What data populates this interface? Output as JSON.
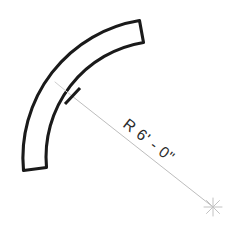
{
  "drawing": {
    "title": "Curved Wall Radius Dimension",
    "background_color": "#ffffff",
    "width": 243,
    "height": 238,
    "dimension": {
      "label": "R 6' - 0\"",
      "prefix": "R",
      "feet": "6'",
      "separator": "-",
      "inches": "0\"",
      "value_text": "6' - 0\"",
      "text_color": "#2b2b2b",
      "text_rotation_deg": 38
    },
    "leader": {
      "name": "radius-leader-line",
      "color": "#bdbdbd",
      "stroke_width": 1,
      "start_x": 72,
      "start_y": 96,
      "end_x": 213,
      "end_y": 207
    },
    "center_mark": {
      "name": "arc-center-crosshair",
      "color": "#c2c2c2",
      "x": 213,
      "y": 207,
      "arm_length": 9
    },
    "arc_tick": {
      "name": "arc-intersection-tick",
      "color": "#1a1a1a",
      "x": 72,
      "y": 96
    },
    "band": {
      "name": "curved-wall-band",
      "stroke_color": "#1a1a1a",
      "fill_color": "#ffffff",
      "stroke_width": 3.1,
      "outer_radius": 139,
      "inner_radius": 116,
      "thickness": 23,
      "start_angle_deg": 218,
      "end_angle_deg": 142
    }
  }
}
